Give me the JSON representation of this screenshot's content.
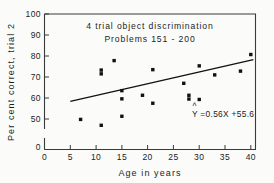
{
  "chart_data": {
    "type": "scatter",
    "title": "4  trial  object  discrimination",
    "subtitle": "Problems  151 - 200",
    "xlabel": "Age in years",
    "ylabel": "Per cent correct, trial 2",
    "xlim": [
      0,
      41
    ],
    "ylim": [
      45,
      100
    ],
    "xticks": [
      "0",
      "5",
      "10",
      "15",
      "20",
      "25",
      "30",
      "35",
      "40"
    ],
    "xtick_values": [
      0,
      5,
      10,
      15,
      20,
      25,
      30,
      35,
      40
    ],
    "yticks": [
      "0",
      "50",
      "60",
      "70",
      "80",
      "90",
      "100"
    ],
    "ytick_values": [
      45,
      50,
      60,
      70,
      80,
      90,
      100
    ],
    "y_axis_break": true,
    "grid": false,
    "legend": "none",
    "points": [
      {
        "x": 7,
        "y": 49.8
      },
      {
        "x": 11,
        "y": 47.0
      },
      {
        "x": 11,
        "y": 71.5
      },
      {
        "x": 11,
        "y": 73.3
      },
      {
        "x": 13.5,
        "y": 77.8
      },
      {
        "x": 15,
        "y": 51.3
      },
      {
        "x": 15,
        "y": 59.6
      },
      {
        "x": 15,
        "y": 63.5
      },
      {
        "x": 19,
        "y": 61.3
      },
      {
        "x": 21,
        "y": 57.5
      },
      {
        "x": 21,
        "y": 73.5
      },
      {
        "x": 27,
        "y": 67.0
      },
      {
        "x": 28,
        "y": 59.5
      },
      {
        "x": 28,
        "y": 61.3
      },
      {
        "x": 30,
        "y": 59.3
      },
      {
        "x": 30,
        "y": 75.3
      },
      {
        "x": 33,
        "y": 71.0
      },
      {
        "x": 38,
        "y": 72.8
      },
      {
        "x": 40,
        "y": 80.7
      }
    ],
    "regression": {
      "label": "Y =0.56X +55.6",
      "label_hat": "^",
      "slope": 0.56,
      "intercept": 55.6,
      "x_start": 5,
      "x_end": 40.5
    },
    "colors": {
      "point": "#111111",
      "line": "#111111",
      "axis": "#3a3a3a",
      "background": "#fbfbf9"
    }
  }
}
